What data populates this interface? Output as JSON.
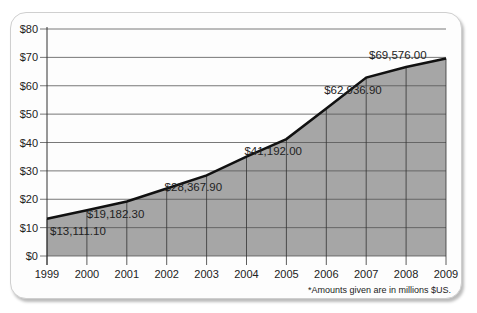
{
  "chart_data": {
    "type": "area",
    "title": "",
    "xlabel": "",
    "ylabel": "",
    "categories": [
      "1999",
      "2000",
      "2001",
      "2002",
      "2003",
      "2004",
      "2005",
      "2006",
      "2007",
      "2008",
      "2009"
    ],
    "series": [
      {
        "name": "Amount (millions $US)",
        "values": [
          13.1,
          16.1,
          19.2,
          23.8,
          28.4,
          35.0,
          41.2,
          52.0,
          62.9,
          66.6,
          69.6
        ]
      }
    ],
    "data_labels": [
      {
        "year": "1999",
        "text": "$13,111.10"
      },
      {
        "year": "2001",
        "text": "$19,182.30"
      },
      {
        "year": "2003",
        "text": "$28,367.90"
      },
      {
        "year": "2005",
        "text": "$41,192.00"
      },
      {
        "year": "2007",
        "text": "$62,936.90"
      },
      {
        "year": "2009",
        "text": "$69,576.00"
      }
    ],
    "yticks": [
      "$0",
      "$10",
      "$20",
      "$30",
      "$40",
      "$50",
      "$60",
      "$70",
      "$80"
    ],
    "ylim": [
      0,
      80
    ],
    "grid": true,
    "legend": "none"
  },
  "footnote": "*Amounts given are in millions $US.",
  "colors": {
    "fill": "#a6a6a6",
    "line": "#111111",
    "grid": "#555555"
  }
}
